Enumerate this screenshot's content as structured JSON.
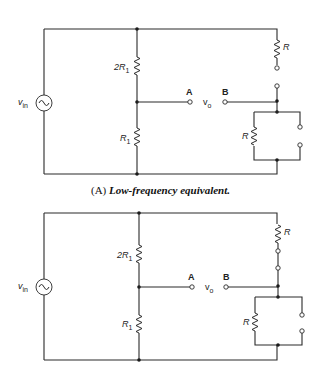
{
  "figure": {
    "caption_a_label": "(A)",
    "caption_a_text": "Low-frequency equivalent.",
    "circuits": [
      {
        "id": "A",
        "source_label": "v",
        "source_sub": "in",
        "resistor_upper": "2R",
        "resistor_upper_sub": "1",
        "resistor_lower": "R",
        "resistor_lower_sub": "1",
        "terminal_a": "A",
        "terminal_b": "B",
        "output_label": "v",
        "output_sub": "o",
        "series_resistor": "R",
        "parallel_resistor": "R"
      },
      {
        "id": "B",
        "source_label": "v",
        "source_sub": "in",
        "resistor_upper": "2R",
        "resistor_upper_sub": "1",
        "resistor_lower": "R",
        "resistor_lower_sub": "1",
        "terminal_a": "A",
        "terminal_b": "B",
        "output_label": "v",
        "output_sub": "o",
        "series_resistor": "R",
        "parallel_resistor": "R"
      }
    ]
  }
}
